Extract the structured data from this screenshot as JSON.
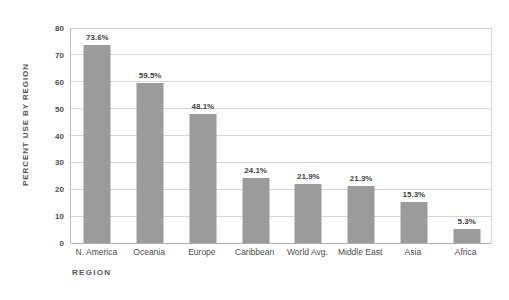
{
  "chart_data": {
    "type": "bar",
    "title": "",
    "xlabel": "REGION",
    "ylabel": "PERCENT USE BY REGION",
    "categories": [
      "N. America",
      "Oceania",
      "Europe",
      "Caribbean",
      "World Avg.",
      "Middle East",
      "Asia",
      "Africa"
    ],
    "values": [
      73.6,
      59.5,
      48.1,
      24.1,
      21.9,
      21.3,
      15.3,
      5.3
    ],
    "value_labels": [
      "73.6%",
      "59.5%",
      "48.1%",
      "24.1%",
      "21.9%",
      "21.3%",
      "15.3%",
      "5.3%"
    ],
    "ylim": [
      0,
      80
    ],
    "ytick_values": [
      0,
      10,
      20,
      30,
      40,
      50,
      60,
      70,
      80
    ],
    "ytick_labels": [
      "0",
      "10",
      "20",
      "30",
      "40",
      "50",
      "60",
      "70",
      "80"
    ],
    "grid": true,
    "grid_axis": "y",
    "legend": false,
    "legend_position": "none",
    "colors": {
      "bar": "#9b9b9b",
      "gridline": "#d6d6d6",
      "axis": "#b0b0b0",
      "text": "#4d4d4d",
      "background": "#ffffff"
    }
  }
}
